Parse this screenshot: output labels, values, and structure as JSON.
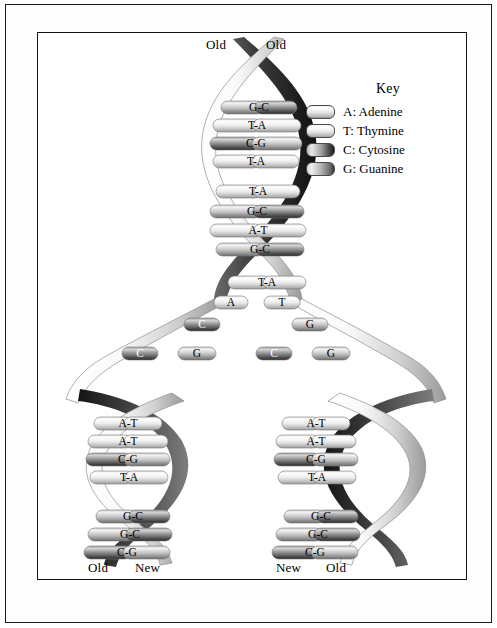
{
  "figure": {
    "background": "#ffffff",
    "frame_color": "#111111"
  },
  "key": {
    "title": "Key",
    "items": [
      {
        "code": "A",
        "label": "A: Adenine",
        "swatch": "sw-A",
        "tone": "light"
      },
      {
        "code": "T",
        "label": "T: Thymine",
        "swatch": "sw-T",
        "tone": "light"
      },
      {
        "code": "C",
        "label": "C: Cytosine",
        "swatch": "sw-C",
        "tone": "dark"
      },
      {
        "code": "G",
        "label": "G: Guanine",
        "swatch": "sw-G",
        "tone": "medium-dark"
      }
    ]
  },
  "labels": {
    "parent_left": "Old",
    "parent_right": "Old",
    "daughter_left_outer": "Old",
    "daughter_left_inner": "New",
    "daughter_right_inner": "New",
    "daughter_right_outer": "Old"
  },
  "chart_data": {
    "type": "diagram",
    "parent_helix": {
      "top_labels": [
        "Old",
        "Old"
      ],
      "base_pairs": [
        "G-C",
        "T-A",
        "C-G",
        "T-A",
        "T-A",
        "G-C",
        "A-T",
        "G-C",
        "T-A"
      ]
    },
    "replication_fork": {
      "left_template_unpaired": [
        "A",
        "C",
        "C",
        "G"
      ],
      "right_template_unpaired": [
        "T",
        "G",
        "C",
        "G"
      ]
    },
    "daughter_left": {
      "bottom_labels": [
        "Old",
        "New"
      ],
      "base_pairs": [
        "A-T",
        "A-T",
        "C-G",
        "T-A",
        "G-C",
        "G-C",
        "C-G"
      ]
    },
    "daughter_right": {
      "bottom_labels": [
        "New",
        "Old"
      ],
      "base_pairs": [
        "A-T",
        "A-T",
        "C-G",
        "T-A",
        "G-C",
        "G-C",
        "C-G"
      ]
    }
  },
  "rungs": {
    "parent": [
      {
        "text": "G-C",
        "x": 183,
        "y": 68,
        "w": 76,
        "left": "G",
        "right": "C"
      },
      {
        "text": "T-A",
        "x": 175,
        "y": 86,
        "w": 88,
        "left": "T",
        "right": "A"
      },
      {
        "text": "C-G",
        "x": 172,
        "y": 104,
        "w": 92,
        "left": "C",
        "right": "G"
      },
      {
        "text": "T-A",
        "x": 175,
        "y": 122,
        "w": 86,
        "left": "T",
        "right": "A"
      },
      {
        "text": "T-A",
        "x": 178,
        "y": 152,
        "w": 84,
        "left": "T",
        "right": "A"
      },
      {
        "text": "G-C",
        "x": 172,
        "y": 172,
        "w": 94,
        "left": "G",
        "right": "C"
      },
      {
        "text": "A-T",
        "x": 172,
        "y": 191,
        "w": 96,
        "left": "A",
        "right": "T"
      },
      {
        "text": "G-C",
        "x": 178,
        "y": 210,
        "w": 88,
        "left": "G",
        "right": "C"
      },
      {
        "text": "T-A",
        "x": 190,
        "y": 243,
        "w": 78,
        "left": "T",
        "right": "A"
      }
    ],
    "fork_left": [
      {
        "text": "A",
        "x": 176,
        "y": 263,
        "w": 34,
        "tone": "light"
      },
      {
        "text": "C",
        "x": 146,
        "y": 285,
        "w": 36,
        "tone": "dark"
      },
      {
        "text": "C",
        "x": 84,
        "y": 314,
        "w": 36,
        "tone": "dark"
      },
      {
        "text": "G",
        "x": 140,
        "y": 314,
        "w": 38,
        "tone": "medium"
      }
    ],
    "fork_right": [
      {
        "text": "T",
        "x": 226,
        "y": 263,
        "w": 36,
        "tone": "light"
      },
      {
        "text": "G",
        "x": 254,
        "y": 285,
        "w": 36,
        "tone": "medium"
      },
      {
        "text": "C",
        "x": 218,
        "y": 314,
        "w": 36,
        "tone": "dark"
      },
      {
        "text": "G",
        "x": 274,
        "y": 314,
        "w": 38,
        "tone": "medium"
      }
    ],
    "daughter_left": [
      {
        "text": "A-T",
        "x": 56,
        "y": 384,
        "w": 68,
        "left": "A",
        "right": "T"
      },
      {
        "text": "A-T",
        "x": 50,
        "y": 402,
        "w": 80,
        "left": "A",
        "right": "T"
      },
      {
        "text": "C-G",
        "x": 48,
        "y": 420,
        "w": 84,
        "left": "C",
        "right": "G"
      },
      {
        "text": "T-A",
        "x": 52,
        "y": 438,
        "w": 78,
        "left": "T",
        "right": "A"
      },
      {
        "text": "G-C",
        "x": 58,
        "y": 477,
        "w": 74,
        "left": "G",
        "right": "C"
      },
      {
        "text": "G-C",
        "x": 50,
        "y": 495,
        "w": 84,
        "left": "G",
        "right": "C"
      },
      {
        "text": "C-G",
        "x": 46,
        "y": 513,
        "w": 86,
        "left": "C",
        "right": "G"
      }
    ],
    "daughter_right": [
      {
        "text": "A-T",
        "x": 244,
        "y": 384,
        "w": 68,
        "left": "A",
        "right": "T"
      },
      {
        "text": "A-T",
        "x": 238,
        "y": 402,
        "w": 80,
        "left": "A",
        "right": "T"
      },
      {
        "text": "C-G",
        "x": 236,
        "y": 420,
        "w": 84,
        "left": "C",
        "right": "G"
      },
      {
        "text": "T-A",
        "x": 240,
        "y": 438,
        "w": 78,
        "left": "T",
        "right": "A"
      },
      {
        "text": "G-C",
        "x": 246,
        "y": 477,
        "w": 74,
        "left": "G",
        "right": "C"
      },
      {
        "text": "G-C",
        "x": 238,
        "y": 495,
        "w": 84,
        "left": "G",
        "right": "C"
      },
      {
        "text": "C-G",
        "x": 234,
        "y": 513,
        "w": 86,
        "left": "C",
        "right": "G"
      }
    ]
  },
  "label_positions": {
    "parent_left": {
      "x": 168,
      "y": 4
    },
    "parent_right": {
      "x": 228,
      "y": 4
    },
    "daughter_left_outer": {
      "x": 50,
      "y": 527
    },
    "daughter_left_inner": {
      "x": 97,
      "y": 527
    },
    "daughter_right_inner": {
      "x": 238,
      "y": 527
    },
    "daughter_right_outer": {
      "x": 288,
      "y": 527
    }
  }
}
